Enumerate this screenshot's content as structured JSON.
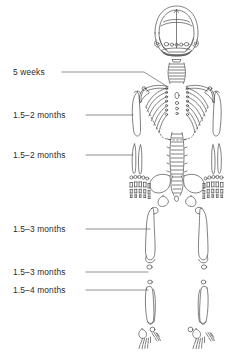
{
  "figure": {
    "view": "anteroposterior whole-body infant skeleton line drawing",
    "ink_color": "#4a4a4a",
    "text_color": "#2a2a2a",
    "background_color": "#ffffff"
  },
  "labels": [
    {
      "id": "cervical-spine",
      "text": "5 weeks",
      "target": "cervical vertebrae / neck",
      "leader": "horizontal then angled down-right"
    },
    {
      "id": "clavicle-humerus-upper",
      "text": "1.5–2 months",
      "target": "proximal humerus / shoulder girdle",
      "leader": "horizontal"
    },
    {
      "id": "forearm",
      "text": "1.5–2 months",
      "target": "radius and ulna",
      "leader": "horizontal"
    },
    {
      "id": "femur",
      "text": "1.5–3 months",
      "target": "femur",
      "leader": "horizontal"
    },
    {
      "id": "tibia-upper",
      "text": "1.5–3 months",
      "target": "proximal tibia",
      "leader": "horizontal"
    },
    {
      "id": "tibia-lower",
      "text": "1.5–4 months",
      "target": "tibia shaft",
      "leader": "horizontal"
    }
  ],
  "anatomy": {
    "regions": [
      "skull",
      "mandible",
      "cervical spine",
      "clavicles",
      "scapulae",
      "ribs",
      "sternum",
      "humeri",
      "thoracic spine",
      "lumbar spine",
      "pelvis",
      "sacrum",
      "radii and ulnae",
      "carpals metacarpals and phalanges",
      "femora",
      "patellae",
      "tibiae and fibulae",
      "tarsals metatarsals and toe phalanges"
    ]
  }
}
